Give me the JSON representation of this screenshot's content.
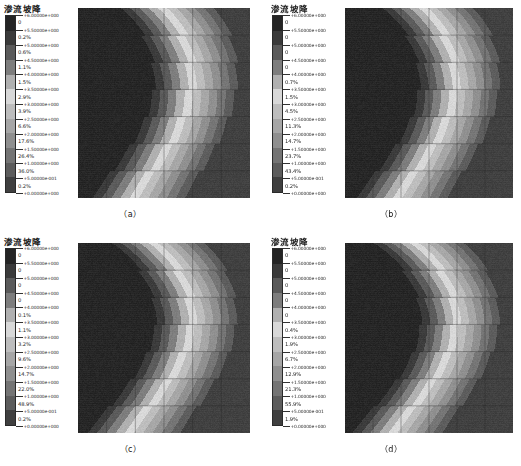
{
  "figure": {
    "background": "#ffffff",
    "panel_count": 4
  },
  "legend_scale": {
    "title": "渗流坡降",
    "tick_labels": [
      "+6.00000e+000",
      "+5.50000e+000",
      "+5.00000e+000",
      "+4.50000e+000",
      "+4.00000e+000",
      "+3.50000e+000",
      "+3.00000e+000",
      "+2.50000e+000",
      "+2.00000e+000",
      "+1.50000e+000",
      "+1.00000e+000",
      "+5.00000e-001",
      "+0.00000e+000"
    ],
    "tick_values": [
      6.0,
      5.5,
      5.0,
      4.5,
      4.0,
      3.5,
      3.0,
      2.5,
      2.0,
      1.5,
      1.0,
      0.5,
      0.0
    ],
    "band_colors": [
      "#242424",
      "#3a3a3a",
      "#5a5a5a",
      "#7d7d7d",
      "#b0b0b0",
      "#d8d8d8",
      "#bdbdbd",
      "#a6a6a6",
      "#8f8f8f",
      "#747474",
      "#5c5c5c",
      "#3f3f3f"
    ]
  },
  "panels": [
    {
      "id": "a",
      "caption": "（a）",
      "legend_title": "渗流坡降",
      "percentages": [
        "0",
        "0.2%",
        "0.6%",
        "1.1%",
        "1.5%",
        "2.9%",
        "3.9%",
        "6.6%",
        "17.6%",
        "26.4%",
        "36.0%",
        "0.2%"
      ]
    },
    {
      "id": "b",
      "caption": "（b）",
      "legend_title": "渗流坡降",
      "percentages": [
        "0",
        "0",
        "0",
        "0",
        "0.7%",
        "1.5%",
        "4.5%",
        "11.3%",
        "14.7%",
        "23.7%",
        "43.4%",
        "0.2%"
      ]
    },
    {
      "id": "c",
      "caption": "（c）",
      "legend_title": "渗流坡降",
      "percentages": [
        "0",
        "0",
        "0",
        "0",
        "0.1%",
        "1.1%",
        "3.2%",
        "9.6%",
        "14.7%",
        "22.0%",
        "48.9%",
        "0.2%"
      ]
    },
    {
      "id": "d",
      "caption": "（d）",
      "legend_title": "渗流坡降",
      "percentages": [
        "0",
        "0",
        "0",
        "0",
        "0",
        "0.4%",
        "1.9%",
        "6.7%",
        "12.9%",
        "21.3%",
        "55.9%",
        "1.9%"
      ]
    }
  ],
  "chart_data": {
    "type": "heatmap",
    "title": "渗流坡降",
    "subtitle": "",
    "xlabel": "",
    "ylabel": "",
    "colormap": "grayscale",
    "contour_levels": [
      0.0,
      0.5,
      1.0,
      1.5,
      2.0,
      2.5,
      3.0,
      3.5,
      4.0,
      4.5,
      5.0,
      5.5,
      6.0
    ],
    "value_range": [
      0.0,
      6.0
    ],
    "legend_position": "left",
    "grid": true,
    "panels": [
      {
        "name": "(a)",
        "area_fractions_percent": [
          0,
          0.2,
          0.6,
          1.1,
          1.5,
          2.9,
          3.9,
          6.6,
          17.6,
          26.4,
          36.0,
          0.2
        ]
      },
      {
        "name": "(b)",
        "area_fractions_percent": [
          0,
          0,
          0,
          0,
          0.7,
          1.5,
          4.5,
          11.3,
          14.7,
          23.7,
          43.4,
          0.2
        ]
      },
      {
        "name": "(c)",
        "area_fractions_percent": [
          0,
          0,
          0,
          0,
          0.1,
          1.1,
          3.2,
          9.6,
          14.7,
          22.0,
          48.9,
          0.2
        ]
      },
      {
        "name": "(d)",
        "area_fractions_percent": [
          0,
          0,
          0,
          0,
          0,
          0.4,
          1.9,
          6.7,
          12.9,
          21.3,
          55.9,
          1.9
        ]
      }
    ]
  }
}
